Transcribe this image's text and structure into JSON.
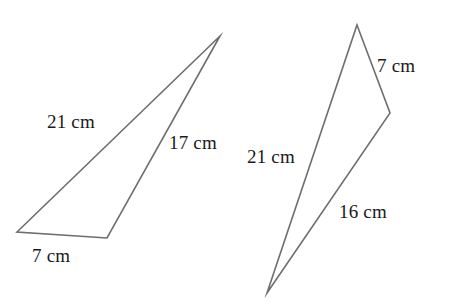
{
  "figure": {
    "background_color": "#ffffff",
    "stroke_color": "#6e6e6e",
    "text_color": "#1a1a1a",
    "units": "cm",
    "shapes": [
      {
        "name": "left-triangle",
        "points": "220,36 17,232 107,238",
        "labels": [
          {
            "name": "left-side-21",
            "text": "21 cm",
            "value": 21
          },
          {
            "name": "left-side-17",
            "text": "17 cm",
            "value": 17
          },
          {
            "name": "left-side-7",
            "text": "7 cm",
            "value": 7
          }
        ]
      },
      {
        "name": "right-triangle",
        "points": "357,25 390,113 267,293",
        "labels": [
          {
            "name": "right-side-7",
            "text": "7 cm",
            "value": 7
          },
          {
            "name": "right-side-21",
            "text": "21 cm",
            "value": 21
          },
          {
            "name": "right-side-16",
            "text": "16 cm",
            "value": 16
          }
        ]
      }
    ]
  }
}
